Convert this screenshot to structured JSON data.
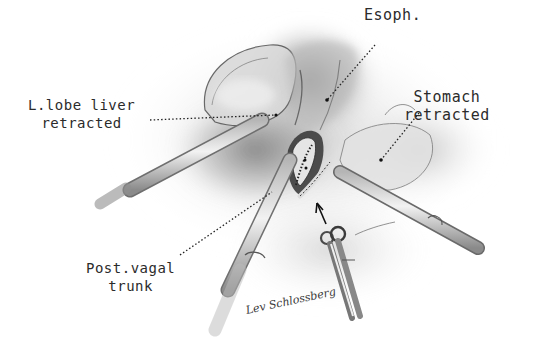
{
  "illustration": {
    "type": "pencil surgical anatomical drawing",
    "palette": {
      "background": "#ffffff",
      "ink": "#2b2b2b",
      "shadow_dark": "#4a4a4a",
      "shadow_mid": "#8c8c8c",
      "shadow_light": "#cfcfcf",
      "instrument_fill": "#e9e9e9"
    }
  },
  "labels": {
    "esophagus": {
      "text": "Esoph."
    },
    "liver": {
      "line1": "L.lobe liver",
      "line2": "retracted"
    },
    "stomach": {
      "line1": "Stomach",
      "line2": "retracted"
    },
    "vagal": {
      "line1": "Post.vagal",
      "line2": "trunk"
    }
  },
  "signature": {
    "text": "Lev Schlossberg"
  },
  "figures": [
    {
      "name": "liver-lobe-retracted",
      "location": "upper-left"
    },
    {
      "name": "esophagus",
      "location": "top-center"
    },
    {
      "name": "stomach",
      "location": "right"
    },
    {
      "name": "esophageal-incision-with-vagal-trunk",
      "location": "center"
    },
    {
      "name": "left-retractor",
      "location": "left"
    },
    {
      "name": "right-retractor",
      "location": "right"
    },
    {
      "name": "lower-retractor",
      "location": "bottom-center"
    },
    {
      "name": "forceps-clamp",
      "location": "bottom-right"
    },
    {
      "name": "indicator-arrow",
      "location": "center"
    }
  ]
}
